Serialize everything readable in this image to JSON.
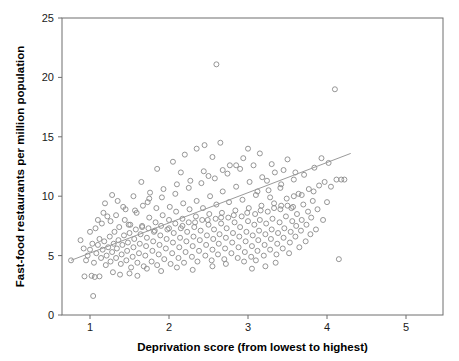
{
  "figure": {
    "background_color": "#ffffff",
    "frame_color": "#6e6e6e",
    "marker_color": "#8a8a8a",
    "line_color": "#9a9a9a",
    "caption_fragment": ""
  },
  "chart_data": {
    "type": "scatter",
    "title": "",
    "xlabel": "Deprivation score (from lowest to highest)",
    "ylabel": "Fast-food restaurants per million population",
    "xlim": [
      0.55,
      5.5
    ],
    "ylim": [
      0,
      25
    ],
    "xticks": [
      1,
      2,
      3,
      4,
      5
    ],
    "xtick_labels": [
      "1",
      "2",
      "3",
      "4",
      "5"
    ],
    "yticks": [
      0,
      5,
      10,
      15,
      20,
      25
    ],
    "ytick_labels": [
      "0",
      "5",
      "10",
      "15",
      "20",
      "25"
    ],
    "grid": false,
    "legend": null,
    "marker": "open-circle",
    "marker_size": 5,
    "trendline": {
      "type": "linear-fit",
      "x_start": 0.76,
      "y_start": 4.6,
      "x_end": 4.3,
      "y_end": 13.6,
      "slope": 2.54,
      "intercept": 2.67
    },
    "points": [
      [
        0.76,
        4.6
      ],
      [
        0.93,
        3.25
      ],
      [
        1.02,
        3.3
      ],
      [
        1.06,
        3.2
      ],
      [
        1.12,
        3.25
      ],
      [
        1.04,
        1.6
      ],
      [
        0.97,
        5.0
      ],
      [
        1.0,
        5.5
      ],
      [
        1.03,
        6.0
      ],
      [
        1.05,
        4.4
      ],
      [
        1.08,
        5.2
      ],
      [
        1.1,
        5.9
      ],
      [
        1.12,
        6.4
      ],
      [
        1.14,
        4.8
      ],
      [
        1.16,
        5.5
      ],
      [
        1.18,
        6.2
      ],
      [
        1.2,
        4.2
      ],
      [
        1.21,
        5.0
      ],
      [
        1.23,
        5.7
      ],
      [
        1.25,
        6.6
      ],
      [
        1.26,
        4.5
      ],
      [
        1.28,
        5.3
      ],
      [
        1.3,
        6.0
      ],
      [
        1.31,
        7.0
      ],
      [
        1.33,
        4.8
      ],
      [
        1.34,
        5.6
      ],
      [
        1.36,
        6.3
      ],
      [
        1.37,
        7.4
      ],
      [
        1.39,
        4.3
      ],
      [
        1.4,
        5.1
      ],
      [
        1.41,
        5.9
      ],
      [
        1.43,
        6.7
      ],
      [
        1.44,
        8.0
      ],
      [
        1.46,
        4.6
      ],
      [
        1.47,
        5.4
      ],
      [
        1.48,
        6.1
      ],
      [
        1.5,
        6.9
      ],
      [
        1.51,
        7.6
      ],
      [
        1.52,
        4.0
      ],
      [
        1.54,
        4.9
      ],
      [
        1.55,
        5.7
      ],
      [
        1.56,
        6.4
      ],
      [
        1.58,
        7.2
      ],
      [
        1.59,
        8.6
      ],
      [
        1.6,
        4.4
      ],
      [
        1.62,
        5.2
      ],
      [
        1.63,
        6.0
      ],
      [
        1.64,
        6.8
      ],
      [
        1.66,
        7.5
      ],
      [
        1.67,
        9.2
      ],
      [
        1.68,
        4.1
      ],
      [
        1.7,
        5.0
      ],
      [
        1.71,
        5.8
      ],
      [
        1.72,
        6.5
      ],
      [
        1.74,
        7.3
      ],
      [
        1.75,
        8.2
      ],
      [
        1.76,
        10.3
      ],
      [
        1.78,
        4.5
      ],
      [
        1.79,
        5.4
      ],
      [
        1.8,
        6.2
      ],
      [
        1.81,
        7.0
      ],
      [
        1.83,
        7.8
      ],
      [
        1.84,
        9.0
      ],
      [
        1.85,
        4.2
      ],
      [
        1.87,
        5.1
      ],
      [
        1.88,
        5.9
      ],
      [
        1.89,
        6.7
      ],
      [
        1.9,
        7.5
      ],
      [
        1.92,
        8.4
      ],
      [
        1.93,
        10.6
      ],
      [
        1.94,
        4.7
      ],
      [
        1.96,
        5.6
      ],
      [
        1.97,
        6.4
      ],
      [
        1.98,
        7.2
      ],
      [
        2.0,
        8.0
      ],
      [
        2.01,
        9.1
      ],
      [
        2.02,
        4.3
      ],
      [
        2.04,
        5.2
      ],
      [
        2.05,
        6.1
      ],
      [
        2.06,
        6.9
      ],
      [
        2.08,
        7.7
      ],
      [
        2.09,
        8.7
      ],
      [
        2.1,
        11.0
      ],
      [
        2.12,
        4.8
      ],
      [
        2.13,
        5.7
      ],
      [
        2.14,
        6.5
      ],
      [
        2.15,
        7.3
      ],
      [
        2.17,
        8.1
      ],
      [
        2.18,
        9.4
      ],
      [
        2.19,
        4.4
      ],
      [
        2.21,
        5.3
      ],
      [
        2.22,
        6.2
      ],
      [
        2.23,
        7.0
      ],
      [
        2.25,
        7.8
      ],
      [
        2.26,
        8.9
      ],
      [
        2.27,
        11.3
      ],
      [
        2.29,
        4.9
      ],
      [
        2.3,
        5.8
      ],
      [
        2.31,
        6.6
      ],
      [
        2.32,
        7.4
      ],
      [
        2.34,
        8.3
      ],
      [
        2.35,
        9.6
      ],
      [
        2.36,
        4.5
      ],
      [
        2.38,
        5.4
      ],
      [
        2.39,
        6.3
      ],
      [
        2.4,
        7.1
      ],
      [
        2.42,
        8.0
      ],
      [
        2.43,
        9.0
      ],
      [
        2.44,
        12.1
      ],
      [
        2.46,
        5.0
      ],
      [
        2.47,
        5.9
      ],
      [
        2.48,
        6.7
      ],
      [
        2.5,
        7.6
      ],
      [
        2.51,
        8.5
      ],
      [
        2.52,
        10.0
      ],
      [
        2.54,
        4.6
      ],
      [
        2.55,
        5.5
      ],
      [
        2.56,
        6.4
      ],
      [
        2.57,
        7.2
      ],
      [
        2.59,
        8.1
      ],
      [
        2.6,
        9.3
      ],
      [
        2.6,
        21.1
      ],
      [
        2.62,
        5.1
      ],
      [
        2.63,
        6.0
      ],
      [
        2.64,
        6.8
      ],
      [
        2.66,
        7.7
      ],
      [
        2.67,
        8.6
      ],
      [
        2.68,
        10.4
      ],
      [
        2.7,
        4.7
      ],
      [
        2.71,
        5.6
      ],
      [
        2.72,
        6.5
      ],
      [
        2.73,
        7.3
      ],
      [
        2.75,
        8.2
      ],
      [
        2.76,
        9.5
      ],
      [
        2.77,
        12.6
      ],
      [
        2.79,
        5.2
      ],
      [
        2.8,
        6.1
      ],
      [
        2.81,
        6.9
      ],
      [
        2.83,
        7.8
      ],
      [
        2.84,
        8.8
      ],
      [
        2.85,
        10.8
      ],
      [
        2.87,
        4.8
      ],
      [
        2.88,
        5.7
      ],
      [
        2.89,
        6.6
      ],
      [
        2.9,
        7.4
      ],
      [
        2.92,
        8.3
      ],
      [
        2.93,
        9.7
      ],
      [
        2.94,
        13.2
      ],
      [
        2.96,
        5.3
      ],
      [
        2.97,
        6.2
      ],
      [
        2.98,
        7.0
      ],
      [
        3.0,
        7.9
      ],
      [
        3.01,
        9.0
      ],
      [
        3.02,
        11.2
      ],
      [
        3.04,
        4.9
      ],
      [
        3.05,
        5.8
      ],
      [
        3.06,
        6.7
      ],
      [
        3.08,
        7.6
      ],
      [
        3.09,
        8.5
      ],
      [
        3.1,
        10.1
      ],
      [
        3.12,
        5.4
      ],
      [
        3.13,
        6.3
      ],
      [
        3.14,
        7.1
      ],
      [
        3.15,
        8.0
      ],
      [
        3.17,
        9.2
      ],
      [
        3.18,
        11.6
      ],
      [
        3.2,
        5.0
      ],
      [
        3.21,
        5.9
      ],
      [
        3.22,
        6.8
      ],
      [
        3.23,
        7.7
      ],
      [
        3.25,
        8.7
      ],
      [
        3.26,
        10.5
      ],
      [
        3.28,
        5.5
      ],
      [
        3.29,
        6.4
      ],
      [
        3.3,
        7.2
      ],
      [
        3.31,
        8.1
      ],
      [
        3.33,
        9.4
      ],
      [
        3.34,
        12.0
      ],
      [
        3.36,
        5.1
      ],
      [
        3.37,
        6.0
      ],
      [
        3.38,
        6.9
      ],
      [
        3.4,
        7.8
      ],
      [
        3.41,
        8.9
      ],
      [
        3.42,
        11.0
      ],
      [
        3.44,
        5.6
      ],
      [
        3.45,
        6.5
      ],
      [
        3.46,
        7.3
      ],
      [
        3.48,
        8.3
      ],
      [
        3.49,
        9.8
      ],
      [
        3.5,
        13.1
      ],
      [
        3.52,
        5.2
      ],
      [
        3.53,
        6.1
      ],
      [
        3.54,
        7.0
      ],
      [
        3.56,
        7.9
      ],
      [
        3.57,
        9.1
      ],
      [
        3.58,
        11.4
      ],
      [
        3.6,
        6.6
      ],
      [
        3.61,
        7.5
      ],
      [
        3.62,
        8.5
      ],
      [
        3.64,
        10.2
      ],
      [
        3.65,
        5.7
      ],
      [
        3.67,
        7.1
      ],
      [
        3.68,
        8.0
      ],
      [
        3.7,
        9.3
      ],
      [
        3.71,
        11.8
      ],
      [
        3.73,
        6.2
      ],
      [
        3.74,
        7.6
      ],
      [
        3.76,
        8.7
      ],
      [
        3.77,
        10.6
      ],
      [
        3.79,
        6.8
      ],
      [
        3.8,
        8.2
      ],
      [
        3.82,
        9.6
      ],
      [
        3.84,
        12.4
      ],
      [
        3.86,
        7.2
      ],
      [
        3.88,
        8.9
      ],
      [
        3.9,
        10.9
      ],
      [
        3.93,
        13.2
      ],
      [
        3.95,
        8.0
      ],
      [
        3.97,
        11.2
      ],
      [
        4.0,
        9.5
      ],
      [
        4.02,
        12.8
      ],
      [
        4.05,
        10.8
      ],
      [
        4.1,
        19.0
      ],
      [
        4.12,
        11.4
      ],
      [
        4.18,
        11.4
      ],
      [
        4.22,
        11.4
      ],
      [
        4.15,
        4.7
      ],
      [
        1.35,
        9.6
      ],
      [
        1.45,
        8.9
      ],
      [
        1.55,
        10.0
      ],
      [
        1.65,
        11.2
      ],
      [
        1.75,
        9.8
      ],
      [
        1.85,
        12.3
      ],
      [
        2.05,
        12.9
      ],
      [
        2.2,
        13.5
      ],
      [
        2.35,
        14.0
      ],
      [
        2.45,
        14.3
      ],
      [
        2.15,
        12.0
      ],
      [
        2.55,
        13.3
      ],
      [
        2.65,
        14.5
      ],
      [
        3.0,
        14.0
      ],
      [
        3.15,
        13.6
      ],
      [
        3.3,
        12.7
      ],
      [
        3.45,
        12.2
      ],
      [
        3.6,
        12.0
      ],
      [
        0.88,
        6.3
      ],
      [
        0.92,
        5.6
      ],
      [
        0.95,
        4.6
      ],
      [
        1.0,
        7.0
      ],
      [
        1.07,
        7.3
      ],
      [
        1.15,
        7.7
      ],
      [
        1.22,
        8.3
      ],
      [
        1.29,
        3.6
      ],
      [
        1.38,
        3.4
      ],
      [
        1.5,
        3.5
      ],
      [
        1.6,
        3.3
      ],
      [
        1.72,
        3.9
      ],
      [
        1.9,
        3.7
      ],
      [
        2.1,
        4.0
      ],
      [
        2.3,
        3.8
      ],
      [
        2.55,
        4.1
      ],
      [
        2.72,
        4.3
      ],
      [
        2.95,
        4.5
      ],
      [
        3.1,
        4.6
      ],
      [
        3.35,
        4.4
      ],
      [
        3.05,
        3.9
      ],
      [
        3.22,
        4.1
      ],
      [
        1.19,
        9.4
      ],
      [
        1.28,
        10.1
      ],
      [
        2.5,
        11.7
      ],
      [
        2.68,
        12.2
      ],
      [
        2.85,
        12.6
      ],
      [
        3.12,
        10.4
      ],
      [
        3.28,
        9.9
      ],
      [
        3.42,
        9.2
      ],
      [
        3.55,
        9.0
      ],
      [
        3.68,
        10.1
      ],
      [
        3.83,
        10.4
      ],
      [
        1.1,
        8.0
      ],
      [
        1.17,
        8.6
      ],
      [
        1.26,
        7.9
      ],
      [
        1.33,
        8.4
      ],
      [
        1.42,
        9.1
      ],
      [
        1.49,
        7.6
      ],
      [
        1.57,
        8.8
      ],
      [
        1.66,
        7.4
      ],
      [
        1.73,
        9.5
      ],
      [
        1.82,
        7.1
      ],
      [
        1.91,
        9.9
      ],
      [
        2.0,
        7.3
      ],
      [
        2.08,
        10.2
      ],
      [
        2.17,
        7.5
      ],
      [
        2.25,
        10.7
      ],
      [
        2.33,
        7.8
      ],
      [
        2.41,
        11.1
      ],
      [
        2.49,
        8.0
      ],
      [
        2.58,
        11.5
      ],
      [
        2.66,
        8.2
      ],
      [
        2.74,
        11.9
      ],
      [
        2.82,
        8.4
      ],
      [
        2.9,
        12.3
      ],
      [
        2.99,
        8.6
      ],
      [
        3.07,
        12.6
      ],
      [
        3.16,
        8.8
      ],
      [
        3.24,
        11.3
      ],
      [
        3.33,
        9.0
      ],
      [
        3.41,
        10.7
      ],
      [
        3.5,
        9.2
      ],
      [
        3.58,
        10.0
      ]
    ]
  }
}
